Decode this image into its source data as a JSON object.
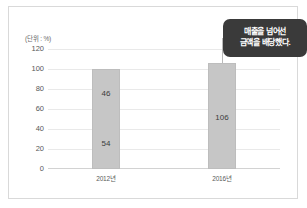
{
  "chart_data": {
    "type": "bar",
    "title": "",
    "subtitle": "",
    "unit_label": "(단위 : %)",
    "xlabel": "",
    "ylabel": "",
    "categories": [
      "2012년",
      "2016년"
    ],
    "values": [
      100,
      106
    ],
    "ylim": [
      0,
      120
    ],
    "ytick_values": [
      0,
      20,
      40,
      60,
      80,
      100,
      120
    ],
    "ytick_labels": [
      "0",
      "20",
      "40",
      "60",
      "80",
      "100",
      "120"
    ],
    "grid": true,
    "legend": "none",
    "bar_segment_labels": [
      [
        {
          "label": "46",
          "value": 46,
          "position_value": 77
        },
        {
          "label": "54",
          "value": 54,
          "position_value": 27
        }
      ],
      [
        {
          "label": "106",
          "value": 106,
          "position_value": 53
        }
      ]
    ],
    "annotations": [
      {
        "text_lines": [
          "매출을 넘어선",
          "금액을 배당했다."
        ],
        "target_category": "2016년",
        "target_value": 106
      }
    ],
    "colors": {
      "bar_fill": "#c6c6c6",
      "bar_stroke": "#bdbdbd",
      "gridline": "#e9e9e9",
      "baseline": "#d2d2d2",
      "tick_text": "#585858",
      "annotation_background": "#3a3a3a",
      "annotation_text": "#ffffff",
      "leader_line": "#b9b9b9",
      "figure_background": "#ffffff",
      "figure_border": "#d9d9d9"
    }
  }
}
